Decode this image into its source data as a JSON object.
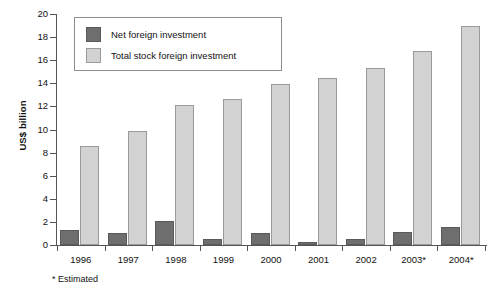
{
  "chart_data": {
    "type": "bar",
    "title": "",
    "subtitle": "",
    "xlabel": "",
    "ylabel": "US$ billion",
    "ylim": [
      0,
      20
    ],
    "ytick_step": 2,
    "yticks": [
      0,
      2,
      4,
      6,
      8,
      10,
      12,
      14,
      16,
      18,
      20
    ],
    "grid": false,
    "legend_position": "top-left-inside",
    "categories": [
      "1996",
      "1997",
      "1998",
      "1999",
      "2000",
      "2001",
      "2002",
      "2003*",
      "2004*"
    ],
    "series": [
      {
        "name": "Net foreign investment",
        "color": "#6e6e6e",
        "values": [
          1.3,
          1.05,
          2.05,
          0.5,
          1.0,
          0.3,
          0.5,
          1.1,
          1.6
        ]
      },
      {
        "name": "Total stock foreign investment",
        "color": "#d2d2d2",
        "values": [
          8.6,
          9.9,
          12.1,
          12.6,
          13.9,
          14.5,
          15.3,
          16.8,
          19.0
        ]
      }
    ],
    "annotations": [
      "* Estimated"
    ]
  },
  "axis": {
    "y_title": "US$ billion",
    "tick_labels": [
      "0",
      "2",
      "4",
      "6",
      "8",
      "10",
      "12",
      "14",
      "16",
      "18",
      "20"
    ]
  },
  "legend": {
    "items": [
      {
        "label": "Net foreign investment",
        "swatch": "net"
      },
      {
        "label": "Total stock foreign investment",
        "swatch": "total"
      }
    ]
  },
  "footnote": {
    "text": "* Estimated"
  }
}
